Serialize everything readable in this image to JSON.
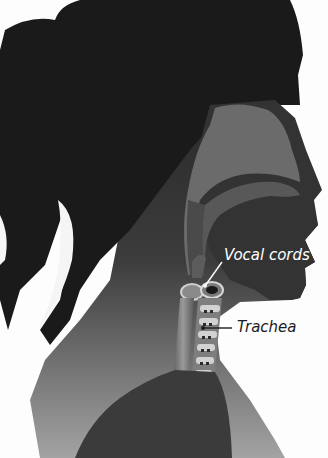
{
  "diagram": {
    "labels": {
      "vocal_cords": "Vocal cords",
      "trachea": "Trachea"
    },
    "colors": {
      "background": "#fdfdfd",
      "hair": "#1c1c1c",
      "head_silhouette": "#2e2e2e",
      "neck_gradient_top": "#3a3a3a",
      "neck_gradient_bottom": "#9a9a9a",
      "nasal_cavity": "#6a6a6a",
      "mouth_cavity": "#555555",
      "lungs": "#3b3b3b",
      "trachea_rings": "#c8c8c8",
      "vocal_label_text": "#ffffff",
      "trachea_label_text": "#1c1c1c"
    }
  }
}
